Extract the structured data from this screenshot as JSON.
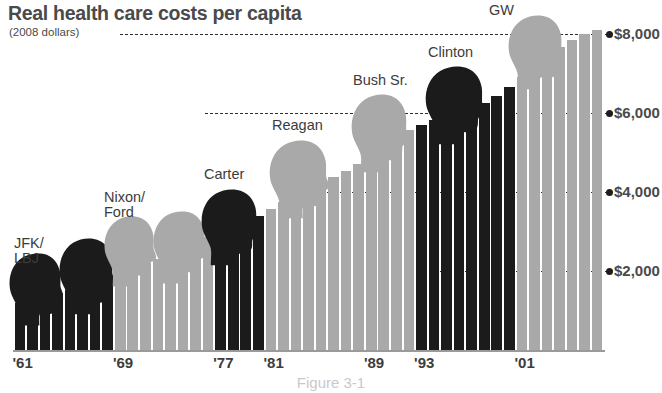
{
  "header": {
    "title": "Real health care costs per capita",
    "subtitle": "(2008 dollars)"
  },
  "figure": {
    "caption": "Figure 3-1"
  },
  "chart_data": {
    "type": "bar",
    "title": "Real health care costs per capita",
    "subtitle": "(2008 dollars)",
    "xlabel": "",
    "ylabel": "",
    "ylim": [
      0,
      8500
    ],
    "grid": true,
    "gridlines": [
      2000,
      4000,
      6000,
      8000
    ],
    "ytick_labels": [
      "$2,000",
      "$4,000",
      "$6,000",
      "$8,000"
    ],
    "xtick_labels": [
      "'61",
      "'69",
      "'77",
      "'81",
      "'89",
      "'93",
      "'01"
    ],
    "xtick_years": [
      1961,
      1969,
      1977,
      1981,
      1989,
      1993,
      2001
    ],
    "legend_position": "none",
    "colors": {
      "democrat": "#1b1b1b",
      "republican": "#a9a9a9",
      "text": "#3c3c3c",
      "title": "#4a4a4a",
      "grid": "#2e2e2e"
    },
    "categories": [
      1961,
      1962,
      1963,
      1964,
      1965,
      1966,
      1967,
      1968,
      1969,
      1970,
      1971,
      1972,
      1973,
      1974,
      1975,
      1976,
      1977,
      1978,
      1979,
      1980,
      1981,
      1982,
      1983,
      1984,
      1985,
      1986,
      1987,
      1988,
      1989,
      1990,
      1991,
      1992,
      1993,
      1994,
      1995,
      1996,
      1997,
      1998,
      1999,
      2000,
      2001,
      2002,
      2003,
      2004,
      2005,
      2006,
      2007
    ],
    "values": [
      1180,
      1260,
      1350,
      1450,
      1530,
      1620,
      1720,
      1830,
      1960,
      2080,
      2200,
      2310,
      2430,
      2560,
      2700,
      2850,
      3000,
      3140,
      3260,
      3400,
      3560,
      3740,
      3930,
      4080,
      4230,
      4380,
      4540,
      4720,
      4900,
      5130,
      5360,
      5570,
      5700,
      5820,
      5920,
      6010,
      6120,
      6260,
      6440,
      6660,
      6900,
      7180,
      7440,
      7660,
      7860,
      8000,
      8100
    ],
    "series": [
      {
        "name": "Democratic administration",
        "color": "#1b1b1b",
        "years": [
          1961,
          1962,
          1963,
          1964,
          1965,
          1966,
          1967,
          1968,
          1977,
          1978,
          1979,
          1980,
          1993,
          1994,
          1995,
          1996,
          1997,
          1998,
          1999,
          2000
        ]
      },
      {
        "name": "Republican administration",
        "color": "#a9a9a9",
        "years": [
          1969,
          1970,
          1971,
          1972,
          1973,
          1974,
          1975,
          1976,
          1981,
          1982,
          1983,
          1984,
          1985,
          1986,
          1987,
          1988,
          1989,
          1990,
          1991,
          1992,
          2001,
          2002,
          2003,
          2004,
          2005,
          2006,
          2007
        ]
      }
    ],
    "annotations": [
      {
        "label": "JFK/\nLBJ",
        "party": "democrat",
        "heads": 2
      },
      {
        "label": "Nixon/\nFord",
        "party": "republican",
        "heads": 2
      },
      {
        "label": "Carter",
        "party": "democrat",
        "heads": 1
      },
      {
        "label": "Reagan",
        "party": "republican",
        "heads": 1
      },
      {
        "label": "Bush Sr.",
        "party": "republican",
        "heads": 1
      },
      {
        "label": "Clinton",
        "party": "democrat",
        "heads": 1
      },
      {
        "label": "GW",
        "party": "republican",
        "heads": 1
      }
    ]
  }
}
